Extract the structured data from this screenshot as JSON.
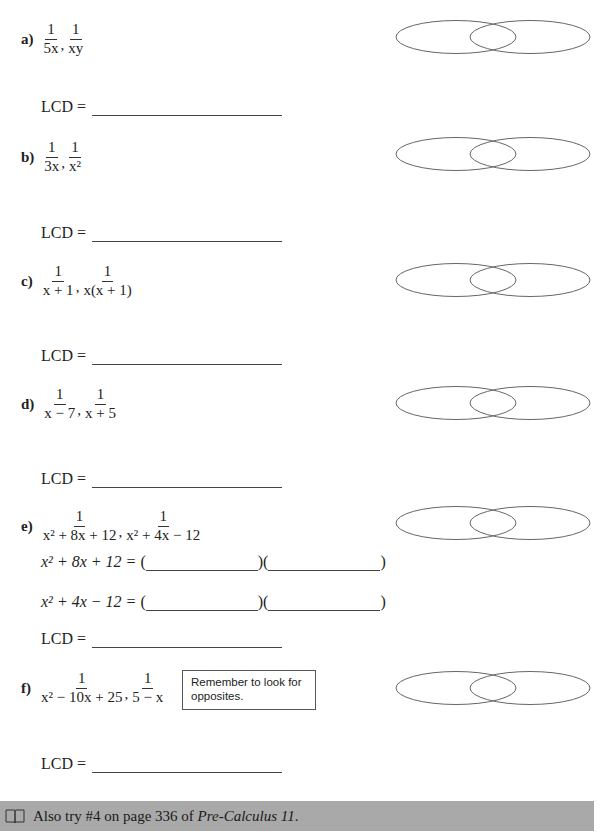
{
  "problems": [
    {
      "id": "a",
      "label": "a)",
      "fractions": [
        {
          "numerator": "1",
          "denominator": "5x"
        },
        {
          "numerator": "1",
          "denominator": "xy"
        }
      ],
      "lcd_label": "LCD =",
      "lcd_value": ""
    },
    {
      "id": "b",
      "label": "b)",
      "fractions": [
        {
          "numerator": "1",
          "denominator": "3x"
        },
        {
          "numerator": "1",
          "denominator": "x²"
        }
      ],
      "lcd_label": "LCD =",
      "lcd_value": ""
    },
    {
      "id": "c",
      "label": "c)",
      "fractions": [
        {
          "numerator": "1",
          "denominator": "x + 1"
        },
        {
          "numerator": "1",
          "denominator": "x(x + 1)"
        }
      ],
      "lcd_label": "LCD =",
      "lcd_value": ""
    },
    {
      "id": "d",
      "label": "d)",
      "fractions": [
        {
          "numerator": "1",
          "denominator": "x − 7"
        },
        {
          "numerator": "1",
          "denominator": "x + 5"
        }
      ],
      "lcd_label": "LCD =",
      "lcd_value": ""
    },
    {
      "id": "e",
      "label": "e)",
      "fractions": [
        {
          "numerator": "1",
          "denominator": "x² + 8x + 12"
        },
        {
          "numerator": "1",
          "denominator": "x² + 4x − 12"
        }
      ],
      "factorizations": [
        {
          "expression": "x² + 8x + 12 =",
          "open": "(",
          "mid": ")(",
          "close": ")"
        },
        {
          "expression": "x² + 4x − 12 =",
          "open": "(",
          "mid": ")(",
          "close": ")"
        }
      ],
      "lcd_label": "LCD =",
      "lcd_value": ""
    },
    {
      "id": "f",
      "label": "f)",
      "fractions": [
        {
          "numerator": "1",
          "denominator": "x² − 10x + 25"
        },
        {
          "numerator": "1",
          "denominator": "5 − x"
        }
      ],
      "hint": "Remember to look for opposites.",
      "lcd_label": "LCD =",
      "lcd_value": ""
    }
  ],
  "footer": {
    "icon": "book-icon",
    "text_prefix": "Also try #4 on page 336 of ",
    "book_title": "Pre-Calculus 11",
    "text_suffix": ".",
    "background": "#a9a9a9"
  },
  "colors": {
    "ink": "#222222",
    "venn_stroke": "#666666"
  }
}
